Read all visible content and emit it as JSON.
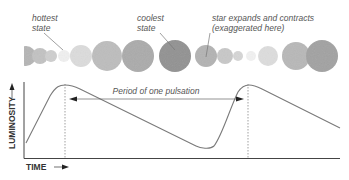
{
  "annotations": {
    "hottest": [
      "hottest",
      "state"
    ],
    "coolest": [
      "coolest",
      "state"
    ],
    "expands": [
      "star expands and contracts",
      "(exaggerated here)"
    ],
    "period": "Period of one pulsation"
  },
  "axes": {
    "y_label": "LUMINOSITY",
    "x_label": "TIME"
  },
  "colors": {
    "curve": "#7a7a7a",
    "axis": "#444444",
    "text": "#555555",
    "star_light": "#e6e6e6",
    "star_mid": "#b8b8b8",
    "star_dark": "#8f8f8f"
  },
  "stars": [
    {
      "cx": 26,
      "r": 10,
      "shade": "#b5b5b5"
    },
    {
      "cx": 40,
      "r": 8,
      "shade": "#c2c2c2"
    },
    {
      "cx": 51,
      "r": 6,
      "shade": "#cfcfcf"
    },
    {
      "cx": 64,
      "r": 6,
      "shade": "#f0f0f0"
    },
    {
      "cx": 81,
      "r": 11,
      "shade": "#dcdcdc"
    },
    {
      "cx": 107,
      "r": 15,
      "shade": "#bdbdbd"
    },
    {
      "cx": 138,
      "r": 16,
      "shade": "#ababab"
    },
    {
      "cx": 175,
      "r": 16,
      "shade": "#929292"
    },
    {
      "cx": 206,
      "r": 11,
      "shade": "#b3b3b3"
    },
    {
      "cx": 225,
      "r": 8,
      "shade": "#c8c8c8"
    },
    {
      "cx": 238,
      "r": 5,
      "shade": "#d6d6d6"
    },
    {
      "cx": 251,
      "r": 5,
      "shade": "#f2f2f2"
    },
    {
      "cx": 268,
      "r": 10,
      "shade": "#dddddd"
    },
    {
      "cx": 296,
      "r": 14,
      "shade": "#b8b8b8"
    },
    {
      "cx": 322,
      "r": 16,
      "shade": "#a2a2a2"
    }
  ]
}
